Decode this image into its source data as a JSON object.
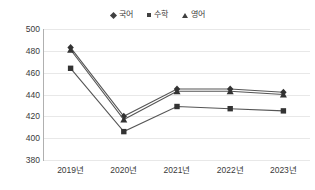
{
  "chart_data": {
    "type": "line",
    "title": "",
    "subtitle": "",
    "xlabel": "",
    "ylabel": "",
    "categories": [
      "2019년",
      "2020년",
      "2021년",
      "2022년",
      "2023년"
    ],
    "ylim": [
      380,
      500
    ],
    "ytick_step": 20,
    "yticks": [
      500,
      480,
      460,
      440,
      420,
      400,
      380
    ],
    "grid": true,
    "legend_position": "top-center",
    "series": [
      {
        "name": "국어",
        "marker": "diamond",
        "color": "#404040",
        "values": [
          483,
          420,
          445,
          445,
          442
        ]
      },
      {
        "name": "수학",
        "marker": "square",
        "color": "#404040",
        "values": [
          464,
          406,
          429,
          427,
          425
        ]
      },
      {
        "name": "영어",
        "marker": "triangle",
        "color": "#404040",
        "values": [
          481,
          417,
          443,
          443,
          440
        ]
      }
    ]
  },
  "legend": {
    "items": [
      {
        "label": "국어",
        "marker": "diamond"
      },
      {
        "label": "수학",
        "marker": "square"
      },
      {
        "label": "영어",
        "marker": "triangle"
      }
    ]
  },
  "axes": {
    "y_labels": [
      "500",
      "480",
      "460",
      "440",
      "420",
      "400",
      "380"
    ],
    "x_labels": [
      "2019년",
      "2020년",
      "2021년",
      "2022년",
      "2023년"
    ]
  },
  "colors": {
    "line": "#555555",
    "marker": "#333333",
    "grid": "#e8e8e8",
    "axis": "#b0b0b0",
    "text": "#3a3a3a",
    "background": "#ffffff"
  }
}
